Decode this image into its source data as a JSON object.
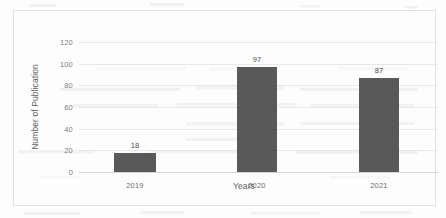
{
  "chart_data": {
    "type": "bar",
    "title": "",
    "categories": [
      "2019",
      "2020",
      "2021"
    ],
    "values": [
      18,
      97,
      87
    ],
    "data_labels": [
      "18",
      "97",
      "87"
    ],
    "xlabel": "Years",
    "ylabel": "Number of Publication",
    "ylim": [
      0,
      120
    ],
    "yticks": [
      0,
      20,
      40,
      60,
      80,
      100,
      120
    ],
    "ytick_labels": [
      "0",
      "20",
      "40",
      "60",
      "80",
      "100",
      "120"
    ],
    "grid": true,
    "legend": false,
    "legend_position": "none",
    "series": [
      {
        "name": "Number of Publication",
        "values": [
          18,
          97,
          87
        ],
        "color": "#595959"
      }
    ]
  },
  "style": {
    "bar_color": "#595959",
    "gridline_color": "#e8e8e8",
    "frame_color": "#e2e2e2",
    "label_color": "#616161",
    "tick_color": "#7d7d7d",
    "background": "#fdfdfd"
  }
}
